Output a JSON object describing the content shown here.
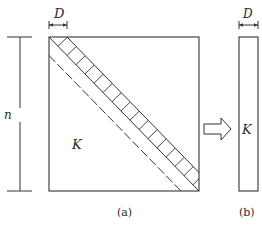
{
  "figure": {
    "panel_a": {
      "matrix_label": "K",
      "width_label": "D",
      "height_label": "n",
      "caption": "(a)"
    },
    "panel_b": {
      "matrix_label": "K",
      "width_label": "D",
      "caption": "(b)"
    },
    "arrow": "transform-arrow",
    "colors": {
      "stroke": "#333333",
      "background": "#ffffff"
    }
  }
}
